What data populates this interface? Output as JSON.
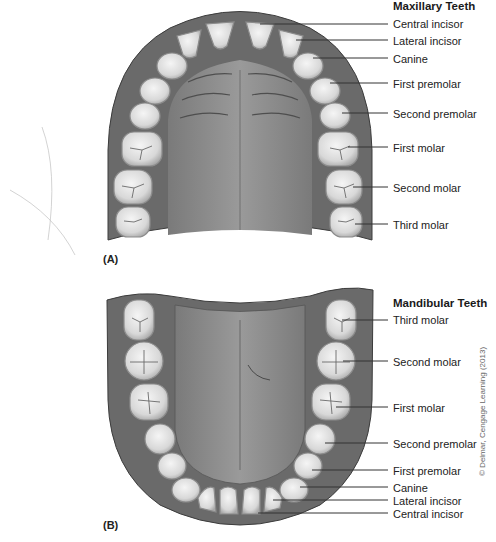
{
  "figure": {
    "panels": [
      {
        "id": "A",
        "label": "(A)",
        "title": "Maxillary Teeth",
        "teeth_labels": [
          "Central incisor",
          "Lateral incisor",
          "Canine",
          "First premolar",
          "Second premolar",
          "First molar",
          "Second molar",
          "Third molar"
        ]
      },
      {
        "id": "B",
        "label": "(B)",
        "title": "Mandibular Teeth",
        "teeth_labels": [
          "Third molar",
          "Second molar",
          "First molar",
          "Second premolar",
          "First premolar",
          "Canine",
          "Lateral incisor",
          "Central incisor"
        ]
      }
    ],
    "credit": "© Delmar, Cengage Learning (2013)",
    "colors": {
      "gum": "#6e6e6e",
      "gum_dark": "#4a4a4a",
      "palate": "#8a8a8a",
      "tooth": "#e6e6e6",
      "tooth_edge": "#9a9a9a",
      "leader": "#333333"
    }
  }
}
